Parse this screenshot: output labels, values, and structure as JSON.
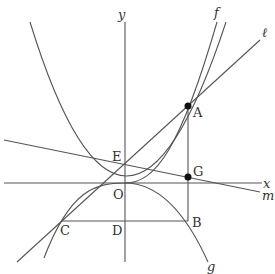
{
  "axes": {
    "x_label": "x",
    "y_label": "y",
    "origin_label": "O"
  },
  "curves": {
    "f_label": "f",
    "g_label": "g"
  },
  "lines": {
    "l_label": "ℓ",
    "m_label": "m"
  },
  "points": {
    "A": "A",
    "B": "B",
    "C": "C",
    "D": "D",
    "E": "E",
    "G": "G"
  },
  "colors": {
    "stroke": "#555555",
    "dot": "#111111"
  }
}
